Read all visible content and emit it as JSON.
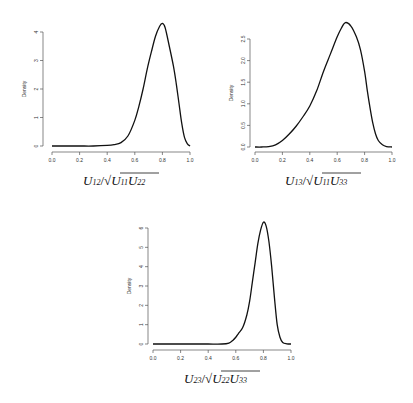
{
  "chart_data": [
    {
      "type": "line",
      "title": "",
      "xlabel": "U_12 / sqrt(U_11 U_22)",
      "xlabel_parts": {
        "num": "U",
        "num_sub": "12",
        "den1": "U",
        "den1_sub": "11",
        "den2": "U",
        "den2_sub": "22"
      },
      "ylabel": "Density",
      "xlim": [
        0.0,
        1.0
      ],
      "ylim": [
        0,
        4.3
      ],
      "x_ticks": [
        "0.0",
        "0.2",
        "0.4",
        "0.6",
        "0.8",
        "1.0"
      ],
      "y_ticks": [
        "0",
        "1",
        "2",
        "3",
        "4"
      ],
      "grid": false,
      "series": [
        {
          "name": "density",
          "x": [
            0.0,
            0.1,
            0.2,
            0.3,
            0.4,
            0.45,
            0.5,
            0.55,
            0.6,
            0.63,
            0.66,
            0.69,
            0.72,
            0.75,
            0.78,
            0.8,
            0.82,
            0.85,
            0.88,
            0.9,
            0.92,
            0.94,
            0.96,
            0.98,
            1.0
          ],
          "y": [
            0.0,
            0.0,
            0.0,
            0.0,
            0.02,
            0.05,
            0.12,
            0.35,
            0.9,
            1.4,
            2.0,
            2.7,
            3.3,
            3.85,
            4.2,
            4.3,
            4.15,
            3.5,
            2.8,
            2.2,
            1.5,
            0.8,
            0.3,
            0.08,
            0.0
          ]
        }
      ]
    },
    {
      "type": "line",
      "title": "",
      "xlabel": "U_13 / sqrt(U_11 U_33)",
      "xlabel_parts": {
        "num": "U",
        "num_sub": "13",
        "den1": "U",
        "den1_sub": "11",
        "den2": "U",
        "den2_sub": "33"
      },
      "ylabel": "Density",
      "xlim": [
        0.0,
        1.0
      ],
      "ylim": [
        0,
        2.9
      ],
      "x_ticks": [
        "0.0",
        "0.2",
        "0.4",
        "0.6",
        "0.8",
        "1.0"
      ],
      "y_ticks": [
        "0.0",
        "0.5",
        "1.0",
        "1.5",
        "2.0",
        "2.5"
      ],
      "grid": false,
      "series": [
        {
          "name": "density",
          "x": [
            0.0,
            0.05,
            0.1,
            0.15,
            0.2,
            0.25,
            0.3,
            0.35,
            0.4,
            0.45,
            0.5,
            0.55,
            0.6,
            0.63,
            0.66,
            0.7,
            0.74,
            0.77,
            0.8,
            0.82,
            0.84,
            0.86,
            0.88,
            0.9,
            0.93,
            0.96,
            1.0
          ],
          "y": [
            0.0,
            0.0,
            0.01,
            0.05,
            0.15,
            0.3,
            0.48,
            0.7,
            0.95,
            1.3,
            1.75,
            2.15,
            2.55,
            2.75,
            2.88,
            2.8,
            2.55,
            2.25,
            1.75,
            1.3,
            0.9,
            0.55,
            0.3,
            0.15,
            0.05,
            0.01,
            0.0
          ]
        }
      ]
    },
    {
      "type": "line",
      "title": "",
      "xlabel": "U_23 / sqrt(U_22 U_33)",
      "xlabel_parts": {
        "num": "U",
        "num_sub": "23",
        "den1": "U",
        "den1_sub": "22",
        "den2": "U",
        "den2_sub": "33"
      },
      "ylabel": "Density",
      "xlim": [
        0.0,
        1.0
      ],
      "ylim": [
        0,
        6.3
      ],
      "x_ticks": [
        "0.0",
        "0.2",
        "0.4",
        "0.6",
        "0.8",
        "1.0"
      ],
      "y_ticks": [
        "0",
        "1",
        "2",
        "3",
        "4",
        "5",
        "6"
      ],
      "grid": false,
      "series": [
        {
          "name": "density",
          "x": [
            0.0,
            0.1,
            0.2,
            0.3,
            0.4,
            0.5,
            0.55,
            0.58,
            0.6,
            0.62,
            0.65,
            0.68,
            0.7,
            0.72,
            0.74,
            0.76,
            0.78,
            0.8,
            0.82,
            0.84,
            0.86,
            0.88,
            0.9,
            0.92,
            0.94,
            0.97,
            1.0
          ],
          "y": [
            0.0,
            0.0,
            0.0,
            0.0,
            0.0,
            0.0,
            0.05,
            0.2,
            0.35,
            0.55,
            0.85,
            1.5,
            2.2,
            3.2,
            4.2,
            5.2,
            5.9,
            6.3,
            6.1,
            5.3,
            4.0,
            2.4,
            1.0,
            0.35,
            0.08,
            0.01,
            0.0
          ]
        }
      ]
    }
  ],
  "panels": [
    {
      "ylabel": "Density"
    },
    {
      "ylabel": "Density"
    },
    {
      "ylabel": "Density"
    }
  ]
}
